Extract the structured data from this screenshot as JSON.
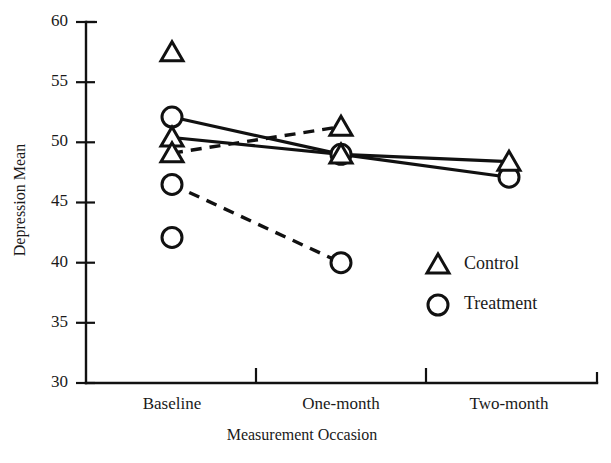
{
  "chart_data": {
    "type": "line",
    "title": "",
    "xlabel": "Measurement Occasion",
    "ylabel": "Depression Mean",
    "categories": [
      "Baseline",
      "One-month",
      "Two-month"
    ],
    "ylim": [
      30,
      60
    ],
    "yticks": [
      30,
      35,
      40,
      45,
      50,
      55,
      60
    ],
    "grid": false,
    "legend_position": "inside-right-lower",
    "legend": [
      {
        "marker": "triangle",
        "label": "Control",
        "line": "solid"
      },
      {
        "marker": "circle",
        "label": "Treatment",
        "line": "solid"
      }
    ],
    "series": [
      {
        "name": "Treatment solid",
        "marker": "circle",
        "line": "solid",
        "x": [
          "Baseline",
          "One-month",
          "Two-month"
        ],
        "values": [
          52.1,
          49.0,
          47.1
        ]
      },
      {
        "name": "Control solid",
        "marker": "triangle",
        "line": "solid",
        "x": [
          "Baseline",
          "One-month",
          "Two-month"
        ],
        "values": [
          50.4,
          49.0,
          48.4
        ]
      },
      {
        "name": "Control dashed",
        "marker": "triangle",
        "line": "dashed",
        "x": [
          "Baseline",
          "One-month"
        ],
        "values": [
          49.1,
          51.3
        ]
      },
      {
        "name": "Treatment dashed",
        "marker": "circle",
        "line": "dashed",
        "x": [
          "Baseline",
          "One-month"
        ],
        "values": [
          46.5,
          40.0
        ]
      }
    ],
    "isolated_points": [
      {
        "marker": "triangle",
        "x": "Baseline",
        "value": 57.5
      },
      {
        "marker": "circle",
        "x": "Baseline",
        "value": 42.1
      }
    ],
    "colors": {
      "ink": "#111111",
      "background": "#ffffff"
    }
  },
  "axis": {
    "y_labels": [
      "60",
      "55",
      "50",
      "45",
      "40",
      "35",
      "30"
    ],
    "x_labels": [
      "Baseline",
      "One-month",
      "Two-month"
    ],
    "y_title": "Depression Mean",
    "x_title": "Measurement Occasion"
  },
  "legend": {
    "control_label": "Control",
    "treatment_label": "Treatment"
  }
}
